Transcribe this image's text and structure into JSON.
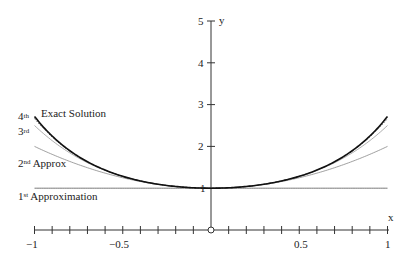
{
  "chart_data": {
    "type": "line",
    "title": "",
    "xlabel": "x",
    "ylabel": "y",
    "xlim": [
      -1,
      1
    ],
    "ylim": [
      0,
      5
    ],
    "x_ticks": [
      -1,
      -0.5,
      0.5,
      1
    ],
    "x_tick_labels": [
      "−1",
      "−0.5",
      "0.5",
      "1"
    ],
    "x_minor_tick_step": 0.1,
    "y_ticks": [
      1,
      2,
      3,
      4,
      5
    ],
    "y_tick_labels": [
      "1",
      "2",
      "3",
      "4",
      "5"
    ],
    "grid": false,
    "origin_marker": "circle",
    "series": [
      {
        "name": "Exact Solution",
        "formula": "e^(x^2)",
        "style": "solid-thick",
        "color": "#111111",
        "x": [
          -1,
          -0.75,
          -0.5,
          -0.25,
          0,
          0.25,
          0.5,
          0.75,
          1
        ],
        "values": [
          2.718,
          1.755,
          1.284,
          1.065,
          1.0,
          1.065,
          1.284,
          1.755,
          2.718
        ]
      },
      {
        "name": "4th",
        "formula": "1 + x^2 + x^4/2 + x^6/6",
        "style": "dotted",
        "color": "#555555",
        "x": [
          -1,
          -0.75,
          -0.5,
          -0.25,
          0,
          0.25,
          0.5,
          0.75,
          1
        ],
        "values": [
          2.667,
          1.749,
          1.284,
          1.064,
          1.0,
          1.064,
          1.284,
          1.749,
          2.667
        ]
      },
      {
        "name": "3rd",
        "formula": "1 + x^2 + x^4/2",
        "style": "thin",
        "color": "#999999",
        "x": [
          -1,
          -0.75,
          -0.5,
          -0.25,
          0,
          0.25,
          0.5,
          0.75,
          1
        ],
        "values": [
          2.5,
          1.721,
          1.281,
          1.064,
          1.0,
          1.064,
          1.281,
          1.721,
          2.5
        ]
      },
      {
        "name": "2nd Approx",
        "formula": "1 + x^2",
        "style": "thin",
        "color": "#888888",
        "x": [
          -1,
          -0.75,
          -0.5,
          -0.25,
          0,
          0.25,
          0.5,
          0.75,
          1
        ],
        "values": [
          2.0,
          1.5625,
          1.25,
          1.0625,
          1.0,
          1.0625,
          1.25,
          1.5625,
          2.0
        ]
      },
      {
        "name": "1st Approximation",
        "formula": "1",
        "style": "thin",
        "color": "#555555",
        "x": [
          -1,
          1
        ],
        "values": [
          1.0,
          1.0
        ]
      }
    ],
    "annotations": [
      {
        "text": "4",
        "sup": "th",
        "x": -1,
        "y": 2.72
      },
      {
        "text": "Exact Solution",
        "x": -0.93,
        "y": 2.78
      },
      {
        "text": "3",
        "sup": "rd",
        "x": -1,
        "y": 2.38
      },
      {
        "text": "2",
        "sup": "nd",
        "suffix": " Approx",
        "x": -1,
        "y": 1.6
      },
      {
        "text": "1",
        "sup": "st",
        "suffix": " Approximation",
        "x": -1,
        "y": 0.7
      }
    ]
  },
  "labels": {
    "x_axis": "x",
    "y_axis": "y",
    "y1": "1",
    "y2": "2",
    "y3": "3",
    "y4": "4",
    "y5": "5",
    "xm1": "−1",
    "xm05": "−0.5",
    "x05": "0.5",
    "x1": "1",
    "ann_4": "4",
    "ann_4_sup": "th",
    "ann_exact": "Exact Solution",
    "ann_3": "3",
    "ann_3_sup": "rd",
    "ann_2": "2",
    "ann_2_sup": "nd",
    "ann_2_rest": " Approx",
    "ann_1": "1",
    "ann_1_sup": "st",
    "ann_1_rest": " Approximation"
  }
}
